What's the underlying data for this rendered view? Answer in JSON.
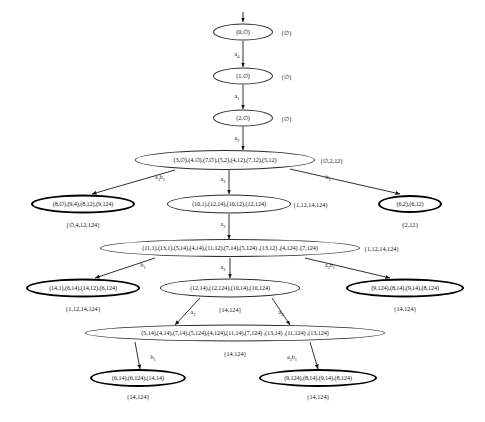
{
  "diagram": {
    "nodes": [
      {
        "id": "n0",
        "text": "(0,∅)",
        "set": "{∅}",
        "bold": false,
        "x": 243,
        "y": 32,
        "w": 60,
        "h": 17,
        "set_x": 281,
        "set_align": "left"
      },
      {
        "id": "n1",
        "text": "(1,∅)",
        "set": "{∅}",
        "bold": false,
        "x": 243,
        "y": 76,
        "w": 60,
        "h": 17,
        "set_x": 281,
        "set_align": "left"
      },
      {
        "id": "n2",
        "text": "(2,∅)",
        "set": "{∅}",
        "bold": false,
        "x": 243,
        "y": 118,
        "w": 60,
        "h": 17,
        "set_x": 281,
        "set_align": "left"
      },
      {
        "id": "n3",
        "text": "(3,∅),(4,∅),(7,∅),(5,2),(4,12),(7,12),(5,12)",
        "set": "{∅,2,12}",
        "bold": false,
        "x": 225,
        "y": 160,
        "w": 180,
        "h": 20,
        "set_x": 320,
        "set_align": "left"
      },
      {
        "id": "n4",
        "text": "(8,∅),(9,4),(8,12),(9,124)",
        "set": "{∅,4,12,124}",
        "bold": true,
        "x": 83,
        "y": 204,
        "w": 104,
        "h": 19,
        "set_x": 83,
        "set_align": "center",
        "set_y": 224
      },
      {
        "id": "n5",
        "text": "(10,1),(12,14),(10,12),(12,124)",
        "set": "{1,12,14,124}",
        "bold": false,
        "x": 229,
        "y": 204,
        "w": 124,
        "h": 19,
        "set_x": 293,
        "set_align": "left"
      },
      {
        "id": "n6",
        "text": "(6,2),(6,12)",
        "set": "{2,12}",
        "bold": true,
        "x": 410,
        "y": 204,
        "w": 64,
        "h": 18,
        "set_x": 410,
        "set_align": "center",
        "set_y": 224
      },
      {
        "id": "n7",
        "text": "(11,1),(13,1),(5,14),(4,14),(11,12),(7,14),(5,124) ,(13,12) ,(4,124) ,(7,124)",
        "set": "{1,12,14,124}",
        "bold": false,
        "x": 230,
        "y": 248,
        "w": 260,
        "h": 18,
        "set_x": 364,
        "set_align": "left"
      },
      {
        "id": "n8",
        "text": "(14,1),(6,14),(14,12),(6,124)",
        "set": "{1,12,14,124}",
        "bold": true,
        "x": 83,
        "y": 288,
        "w": 114,
        "h": 19,
        "set_x": 83,
        "set_align": "center",
        "set_y": 308
      },
      {
        "id": "n9",
        "text": "(12,14),(12,124),(10,14),(10,124)",
        "set": "",
        "bold": false,
        "x": 230,
        "y": 288,
        "w": 140,
        "h": 19,
        "set_x": 230,
        "set_align": "center",
        "set_y": 308
      },
      {
        "id": "n10",
        "text": "(9,124),(8,14),(9,14),(8,124)",
        "set": "{14,124}",
        "bold": true,
        "x": 405,
        "y": 288,
        "w": 118,
        "h": 19,
        "set_x": 405,
        "set_align": "center",
        "set_y": 308
      },
      {
        "id": "n11",
        "text": "(5,14),(4,14),(7,14),(5,124),(4,124),(11,14),(7,124) ,(13,14) ,(11,124) ,(13,124)",
        "set": "",
        "bold": false,
        "x": 235,
        "y": 333,
        "w": 300,
        "h": 17,
        "set_x": 235,
        "set_align": "center",
        "set_y": 352
      },
      {
        "id": "n12",
        "text": "(6,14),(6,124),(14,14)",
        "set": "{14,124}",
        "bold": true,
        "x": 138,
        "y": 378,
        "w": 96,
        "h": 18,
        "set_x": 138,
        "set_align": "center",
        "set_y": 396
      },
      {
        "id": "n13",
        "text": "(9,124),(8,14),(9,14),(8,124)",
        "set": "{14,124}",
        "bold": true,
        "x": 318,
        "y": 378,
        "w": 118,
        "h": 18,
        "set_x": 318,
        "set_align": "center",
        "set_y": 396
      }
    ],
    "set_labels_extra": [
      {
        "id": "s9",
        "text": "{14,124}",
        "x": 230,
        "y": 309
      },
      {
        "id": "s11",
        "text": "{14,124}",
        "x": 235,
        "y": 353
      }
    ],
    "edges": [
      {
        "from": "n0",
        "to": "n1",
        "label_base": "a",
        "label_sub": "4",
        "lx": 237,
        "ly": 55,
        "x1": 243,
        "y1": 41,
        "x2": 243,
        "y2": 67
      },
      {
        "from": "n1",
        "to": "n2",
        "label_base": "a",
        "label_sub": "1",
        "lx": 237,
        "ly": 97,
        "x1": 243,
        "y1": 85,
        "x2": 243,
        "y2": 109
      },
      {
        "from": "n2",
        "to": "n3",
        "label_base": "a",
        "label_sub": "2",
        "lx": 237,
        "ly": 139,
        "x1": 243,
        "y1": 127,
        "x2": 243,
        "y2": 150
      },
      {
        "from": "n3",
        "to": "n4",
        "label_base": "a",
        "label_sub": "3",
        "label_suffix": "b",
        "label_sub2": "1",
        "lx": 160,
        "ly": 178,
        "x1": 175,
        "y1": 170,
        "x2": 92,
        "y2": 194
      },
      {
        "from": "n3",
        "to": "n5",
        "label_base": "a",
        "label_sub": "3",
        "lx": 223,
        "ly": 180,
        "x1": 229,
        "y1": 170,
        "x2": 229,
        "y2": 194
      },
      {
        "from": "n3",
        "to": "n6",
        "label_base": "b",
        "label_sub": "1",
        "lx": 328,
        "ly": 178,
        "x1": 290,
        "y1": 169,
        "x2": 400,
        "y2": 194
      },
      {
        "from": "n5",
        "to": "n7",
        "label_base": "a",
        "label_sub": "2",
        "lx": 223,
        "ly": 225,
        "x1": 229,
        "y1": 214,
        "x2": 229,
        "y2": 239
      },
      {
        "from": "n7",
        "to": "n8",
        "label_base": "b",
        "label_sub": "1",
        "lx": 143,
        "ly": 266,
        "x1": 155,
        "y1": 258,
        "x2": 95,
        "y2": 278
      },
      {
        "from": "n7",
        "to": "n9",
        "label_base": "a",
        "label_sub": "3",
        "lx": 223,
        "ly": 268,
        "x1": 230,
        "y1": 258,
        "x2": 230,
        "y2": 278
      },
      {
        "from": "n7",
        "to": "n10",
        "label_base": "a",
        "label_sub": "2",
        "label_suffix": "b",
        "label_sub2": "1",
        "lx": 330,
        "ly": 266,
        "x1": 305,
        "y1": 258,
        "x2": 390,
        "y2": 278
      },
      {
        "from": "n9",
        "to": "n11",
        "label_base": "a",
        "label_sub": "2",
        "lx": 193,
        "ly": 313,
        "x1": 200,
        "y1": 298,
        "x2": 175,
        "y2": 325
      },
      {
        "from": "n9",
        "to": "n11b",
        "label_base": "a",
        "label_sub": "3",
        "lx": 281,
        "ly": 313,
        "x1": 272,
        "y1": 298,
        "x2": 290,
        "y2": 325
      },
      {
        "from": "n11",
        "to": "n12",
        "label_base": "b",
        "label_sub": "1",
        "lx": 153,
        "ly": 358,
        "x1": 135,
        "y1": 342,
        "x2": 140,
        "y2": 369
      },
      {
        "from": "n11",
        "to": "n13",
        "label_base": "a",
        "label_sub": "3",
        "label_suffix": "b",
        "label_sub2": "1",
        "lx": 292,
        "ly": 358,
        "x1": 310,
        "y1": 342,
        "x2": 318,
        "y2": 369
      }
    ],
    "root_arrow": {
      "x": 243,
      "y_from": 12,
      "y_to": 22
    }
  }
}
